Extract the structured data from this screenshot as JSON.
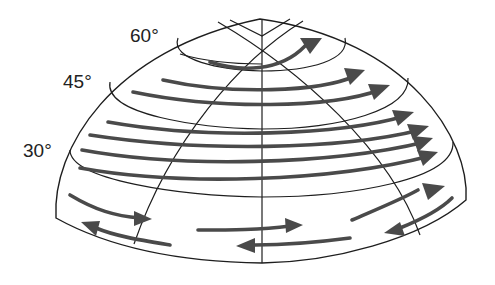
{
  "diagram": {
    "labels": {
      "lat60": "60°",
      "lat45": "45°",
      "lat30": "30°"
    },
    "colors": {
      "background": "#ffffff",
      "hemisphere_fill": "#f1f1f1",
      "outline": "#1e1e1e",
      "arrow": "#4a4a4a",
      "text": "#222222"
    },
    "flow_bands": [
      {
        "band": "polar cap (above 60°)",
        "direction": "eastward"
      },
      {
        "band": "60°–45°",
        "direction": "eastward"
      },
      {
        "band": "45°–30°",
        "direction": "eastward"
      },
      {
        "band": "below 30° upper",
        "direction": "eastward"
      },
      {
        "band": "below 30° lower",
        "direction": "westward"
      }
    ]
  }
}
